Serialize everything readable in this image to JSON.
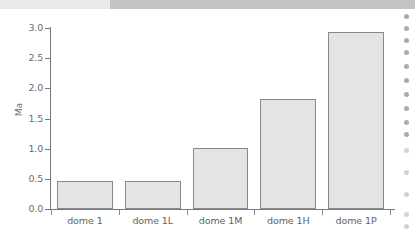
{
  "page": {
    "background_color": "#ffffff",
    "top_band": {
      "name": "scanned-page-top-band",
      "left_color": "#e9e9ea",
      "right_color": "#c2c3c5"
    },
    "edge_artifact": {
      "name": "scan-edge-dots",
      "color": "#9b9c9e",
      "dot_offsets": [
        2,
        14,
        26,
        38,
        52,
        66,
        80,
        94,
        108,
        120,
        136,
        158,
        180,
        200,
        212
      ]
    }
  },
  "chart_data": {
    "type": "bar",
    "title": "",
    "xlabel": "",
    "ylabel": "Ma",
    "categories": [
      "dome 1",
      "dome 1L",
      "dome 1M",
      "dome 1H",
      "dome 1P"
    ],
    "values": [
      0.47,
      0.47,
      1.01,
      1.82,
      2.94
    ],
    "ylim": [
      0.0,
      3.0
    ],
    "ytick_labels": [
      "0.0",
      "0.5",
      "1.0",
      "1.5",
      "2.0",
      "2.5",
      "3.0"
    ],
    "ytick_values": [
      0.0,
      0.5,
      1.0,
      1.5,
      2.0,
      2.5,
      3.0
    ],
    "grid": false,
    "legend": null,
    "bar_fill_color": "#e4e4e4",
    "bar_edge_color": "#88898c",
    "axis_color": "#77797c",
    "tick_label_color": "#6b6d70"
  }
}
